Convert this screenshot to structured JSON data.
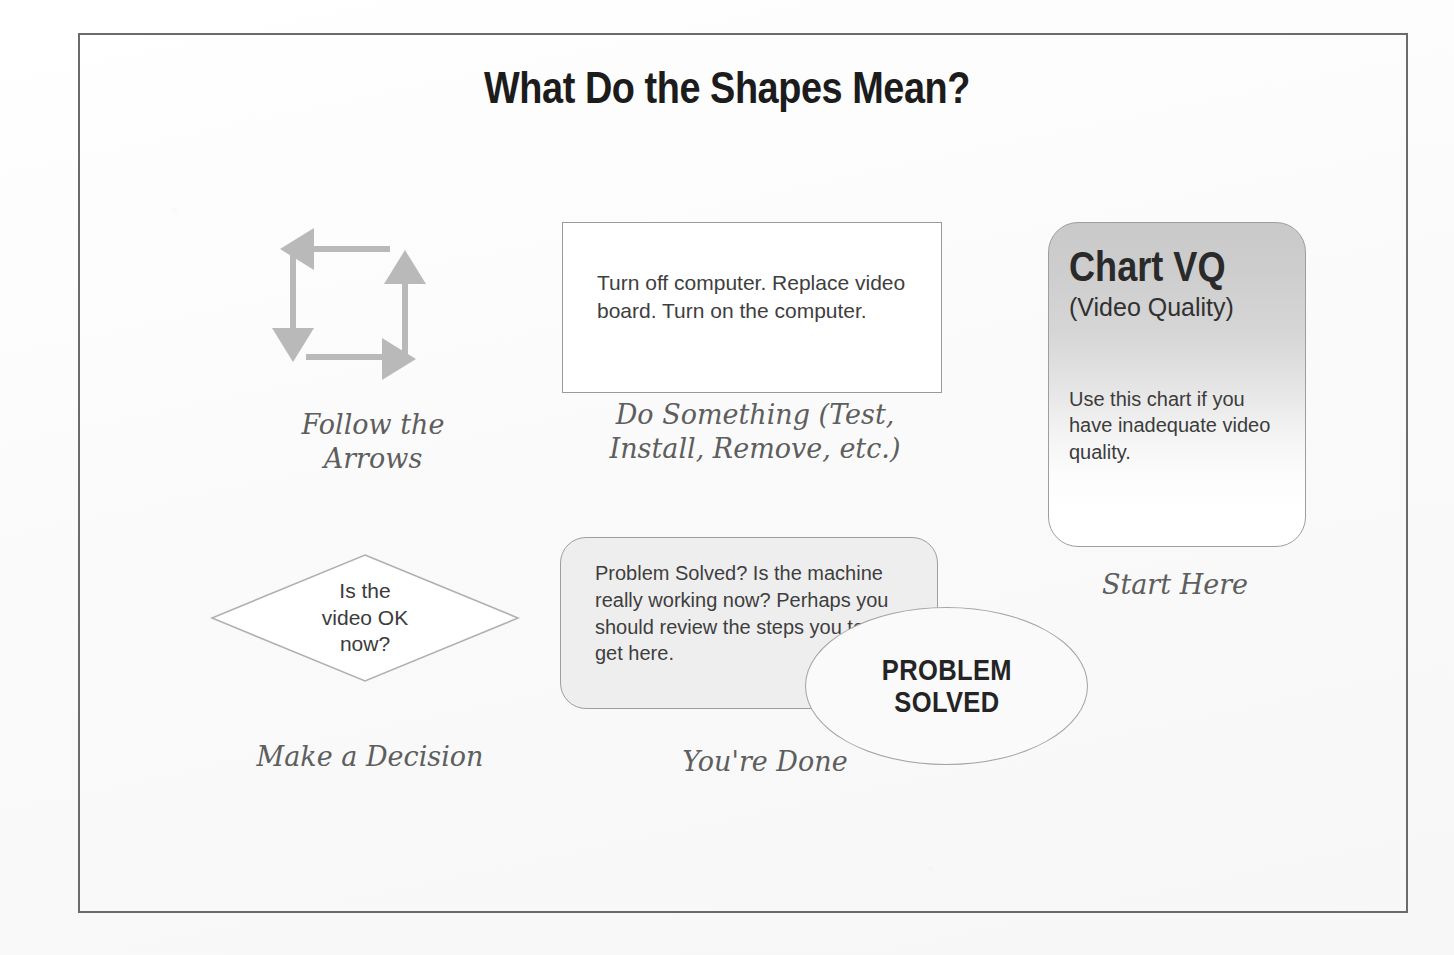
{
  "page": {
    "title": "What Do the Shapes Mean?",
    "background_color": "#fdfdfd",
    "frame_border_color": "#6b6b6b"
  },
  "legend": {
    "arrows": {
      "caption": "Follow the\nArrows",
      "icon": "four-arrow-cycle-icon",
      "arrow_color": "#b9b9b9",
      "arrows": [
        {
          "name": "arrow-left",
          "direction": "left"
        },
        {
          "name": "arrow-down",
          "direction": "down"
        },
        {
          "name": "arrow-right",
          "direction": "right"
        },
        {
          "name": "arrow-up",
          "direction": "up"
        }
      ]
    },
    "process": {
      "caption": "Do Something (Test,\nInstall, Remove, etc.)",
      "text": "Turn off computer.  Replace video board.  Turn on the computer.",
      "fill_color": "#ffffff",
      "border_color": "#9a9a9a"
    },
    "chart_card": {
      "caption": "Start Here",
      "title": "Chart VQ",
      "subtitle": "(Video Quality)",
      "body": "Use this chart if you have inadequate video quality.",
      "gradient_from": "#c9c9c9",
      "gradient_to": "#ffffff",
      "border_color": "#9e9e9e"
    },
    "decision": {
      "caption": "Make a Decision",
      "text": "Is the\nvideo OK\nnow?",
      "border_color": "#b0b0b0",
      "fill_color": "#ffffff"
    },
    "done": {
      "caption": "You're Done",
      "text": "Problem Solved?  Is the machine really working now?  Perhaps you should review the steps you took to get here.",
      "fill_color": "#eeeeee",
      "border_color": "#9e9e9e"
    },
    "problem_solved": {
      "label": "PROBLEM\nSOLVED",
      "fill_color": "#fafafa",
      "border_color": "#a3a3a3"
    }
  }
}
